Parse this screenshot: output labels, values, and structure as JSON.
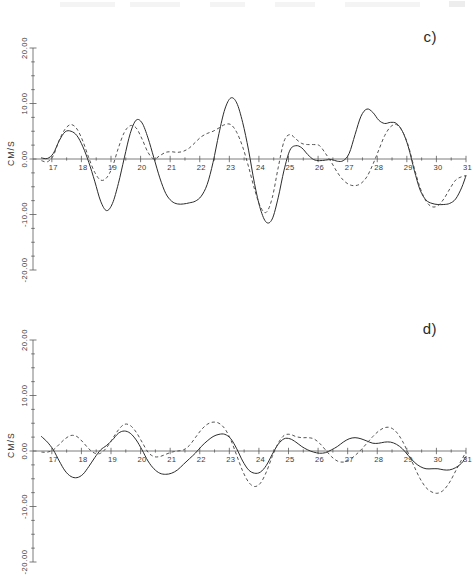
{
  "figure": {
    "panels": [
      {
        "id": "c",
        "label": "c)",
        "axis_title": "CM/S"
      },
      {
        "id": "d",
        "label": "d)",
        "axis_title": "CM/S"
      }
    ]
  },
  "chart_data": [
    {
      "type": "line",
      "title": "c)",
      "xlabel": "",
      "ylabel": "CM/S",
      "xlim": [
        16.6,
        31.0
      ],
      "ylim": [
        -20.0,
        20.0
      ],
      "grid": false,
      "legend_position": "none",
      "xticks": [
        17,
        18,
        19,
        20,
        21,
        22,
        23,
        24,
        25,
        26,
        27,
        28,
        29,
        30,
        31
      ],
      "xtick_labels": [
        "17",
        "18",
        "19",
        "20",
        "21",
        "22",
        "23",
        "24",
        "25",
        "26",
        "27",
        "28",
        "29",
        "30",
        "31"
      ],
      "yticks": [
        20.0,
        10.0,
        0.0,
        -10.0,
        -20.0
      ],
      "ytick_labels": [
        "20.00",
        "10.00",
        "0.00",
        "-20.00",
        "-20.00"
      ],
      "ytick_labels_actual": [
        "20.00",
        "10.00",
        "0.00",
        "-10.00",
        "-20.00"
      ],
      "series": [
        {
          "name": "solid",
          "style": "solid",
          "x": [
            16.65,
            16.85,
            17.05,
            17.25,
            17.45,
            17.65,
            17.85,
            18.05,
            18.25,
            18.45,
            18.65,
            18.85,
            19.05,
            19.25,
            19.45,
            19.65,
            19.85,
            20.05,
            20.25,
            20.45,
            20.65,
            20.85,
            21.05,
            21.25,
            21.45,
            21.65,
            21.85,
            22.05,
            22.25,
            22.45,
            22.65,
            22.85,
            23.05,
            23.25,
            23.45,
            23.65,
            23.85,
            24.05,
            24.25,
            24.45,
            24.65,
            24.85,
            25.05,
            25.25,
            25.45,
            25.65,
            25.85,
            26.05,
            26.25,
            26.45,
            26.65,
            26.85,
            27.05,
            27.25,
            27.45,
            27.65,
            27.85,
            28.05,
            28.25,
            28.45,
            28.65,
            28.85,
            29.05,
            29.25,
            29.45,
            29.65,
            29.85,
            30.05,
            30.25,
            30.45,
            30.65,
            30.85,
            31.0
          ],
          "y": [
            0.2,
            0.1,
            1.0,
            3.3,
            4.9,
            5.0,
            4.2,
            2.2,
            -0.6,
            -4.0,
            -7.6,
            -9.3,
            -8.0,
            -4.4,
            0.2,
            4.6,
            7.0,
            6.5,
            3.8,
            0.2,
            -3.4,
            -6.2,
            -7.6,
            -8.1,
            -8.1,
            -7.9,
            -7.6,
            -6.7,
            -4.6,
            -0.6,
            4.6,
            9.0,
            11.0,
            10.1,
            6.6,
            1.6,
            -4.4,
            -9.0,
            -11.4,
            -10.8,
            -7.0,
            -2.0,
            1.6,
            2.4,
            2.0,
            0.8,
            -0.1,
            -0.3,
            -0.2,
            -0.1,
            -0.4,
            -0.3,
            1.0,
            4.4,
            7.7,
            9.0,
            8.4,
            7.0,
            6.4,
            6.6,
            6.4,
            5.0,
            2.2,
            -2.0,
            -5.6,
            -7.4,
            -8.0,
            -8.2,
            -8.2,
            -8.0,
            -7.2,
            -5.2,
            -3.0
          ]
        },
        {
          "name": "dashed",
          "style": "dashed",
          "x": [
            16.65,
            16.85,
            17.05,
            17.25,
            17.45,
            17.65,
            17.85,
            18.05,
            18.25,
            18.45,
            18.65,
            18.85,
            19.05,
            19.25,
            19.45,
            19.65,
            19.85,
            20.05,
            20.25,
            20.45,
            20.65,
            20.85,
            21.05,
            21.25,
            21.45,
            21.65,
            21.85,
            22.05,
            22.25,
            22.45,
            22.65,
            22.85,
            23.05,
            23.25,
            23.45,
            23.65,
            23.85,
            24.05,
            24.25,
            24.45,
            24.65,
            24.85,
            25.05,
            25.25,
            25.45,
            25.65,
            25.85,
            26.05,
            26.25,
            26.45,
            26.65,
            26.85,
            27.05,
            27.25,
            27.45,
            27.65,
            27.85,
            28.05,
            28.25,
            28.45,
            28.65,
            28.85,
            29.05,
            29.25,
            29.45,
            29.65,
            29.85,
            30.05,
            30.25,
            30.45,
            30.65,
            30.85,
            31.0
          ],
          "y": [
            -0.3,
            -0.5,
            0.6,
            3.4,
            5.4,
            6.2,
            5.4,
            3.2,
            0.2,
            -2.4,
            -3.8,
            -3.4,
            -1.4,
            2.0,
            4.8,
            6.0,
            5.6,
            3.6,
            1.2,
            0.0,
            0.6,
            1.2,
            1.3,
            1.2,
            1.4,
            2.0,
            3.0,
            4.0,
            4.6,
            5.0,
            5.6,
            6.2,
            6.2,
            4.8,
            2.2,
            -1.4,
            -5.4,
            -8.6,
            -9.6,
            -7.0,
            -1.6,
            3.2,
            4.4,
            3.6,
            2.8,
            2.6,
            2.6,
            2.4,
            1.0,
            -0.6,
            -2.4,
            -3.8,
            -4.6,
            -4.8,
            -4.4,
            -3.2,
            -1.0,
            1.6,
            4.2,
            5.8,
            6.2,
            5.0,
            2.4,
            -1.6,
            -5.2,
            -7.6,
            -8.6,
            -8.4,
            -7.2,
            -5.4,
            -3.8,
            -3.2,
            -3.0
          ]
        }
      ]
    },
    {
      "type": "line",
      "title": "d)",
      "xlabel": "",
      "ylabel": "CM/S",
      "xlim": [
        16.6,
        31.0
      ],
      "ylim": [
        -20.0,
        20.0
      ],
      "grid": false,
      "legend_position": "none",
      "xticks": [
        17,
        18,
        19,
        20,
        21,
        22,
        23,
        24,
        25,
        26,
        27,
        28,
        29,
        30,
        31
      ],
      "xtick_labels": [
        "17",
        "18",
        "19",
        "20",
        "21",
        "22",
        "23",
        "24",
        "25",
        "26",
        "27",
        "28",
        "29",
        "30",
        "31"
      ],
      "yticks": [
        20.0,
        10.0,
        0.0,
        -10.0,
        -20.0
      ],
      "ytick_labels": [
        "20.00",
        "10.00",
        "0.00",
        "-10.00",
        "-20.00"
      ],
      "series": [
        {
          "name": "solid",
          "style": "solid",
          "x": [
            16.65,
            16.85,
            17.05,
            17.25,
            17.45,
            17.65,
            17.85,
            18.05,
            18.25,
            18.45,
            18.65,
            18.85,
            19.05,
            19.25,
            19.45,
            19.65,
            19.85,
            20.05,
            20.25,
            20.45,
            20.65,
            20.85,
            21.05,
            21.25,
            21.45,
            21.65,
            21.85,
            22.05,
            22.25,
            22.45,
            22.65,
            22.85,
            23.05,
            23.25,
            23.45,
            23.65,
            23.85,
            24.05,
            24.25,
            24.45,
            24.65,
            24.85,
            25.05,
            25.25,
            25.45,
            25.65,
            25.85,
            26.05,
            26.25,
            26.45,
            26.65,
            26.85,
            27.05,
            27.25,
            27.45,
            27.65,
            27.85,
            28.05,
            28.25,
            28.45,
            28.65,
            28.85,
            29.05,
            29.25,
            29.45,
            29.65,
            29.85,
            30.05,
            30.25,
            30.45,
            30.65,
            30.85,
            31.0
          ],
          "y": [
            2.6,
            1.6,
            0.2,
            -1.8,
            -3.6,
            -4.6,
            -4.8,
            -4.2,
            -2.8,
            -1.2,
            0.2,
            1.0,
            2.0,
            3.2,
            3.6,
            3.2,
            2.0,
            0.2,
            -1.8,
            -3.2,
            -4.0,
            -4.2,
            -4.0,
            -3.4,
            -2.4,
            -1.4,
            -0.4,
            0.8,
            1.8,
            2.6,
            3.0,
            3.0,
            2.2,
            0.4,
            -1.8,
            -3.4,
            -4.0,
            -3.8,
            -2.6,
            -0.6,
            1.2,
            2.2,
            2.2,
            1.6,
            0.8,
            0.2,
            -0.2,
            -0.4,
            -0.3,
            0.2,
            0.8,
            1.6,
            2.2,
            2.4,
            2.2,
            1.8,
            1.4,
            1.4,
            1.6,
            1.6,
            1.2,
            0.4,
            -0.8,
            -2.0,
            -2.8,
            -3.2,
            -3.2,
            -3.2,
            -3.4,
            -3.4,
            -3.0,
            -2.2,
            -1.0
          ]
        },
        {
          "name": "dashed",
          "style": "dashed",
          "x": [
            16.65,
            16.85,
            17.05,
            17.25,
            17.45,
            17.65,
            17.85,
            18.05,
            18.25,
            18.45,
            18.65,
            18.85,
            19.05,
            19.25,
            19.45,
            19.65,
            19.85,
            20.05,
            20.25,
            20.45,
            20.65,
            20.85,
            21.05,
            21.25,
            21.45,
            21.65,
            21.85,
            22.05,
            22.25,
            22.45,
            22.65,
            22.85,
            23.05,
            23.25,
            23.45,
            23.65,
            23.85,
            24.05,
            24.25,
            24.45,
            24.65,
            24.85,
            25.05,
            25.25,
            25.45,
            25.65,
            25.85,
            26.05,
            26.25,
            26.45,
            26.65,
            26.85,
            27.05,
            27.25,
            27.45,
            27.65,
            27.85,
            28.05,
            28.25,
            28.45,
            28.65,
            28.85,
            29.05,
            29.25,
            29.45,
            29.65,
            29.85,
            30.05,
            30.25,
            30.45,
            30.65,
            30.85,
            31.0
          ],
          "y": [
            -0.2,
            -0.2,
            0.2,
            1.2,
            2.2,
            2.8,
            2.6,
            1.6,
            0.4,
            -0.4,
            -0.4,
            0.6,
            2.2,
            3.8,
            4.8,
            4.6,
            3.4,
            1.6,
            -0.2,
            -1.0,
            -1.0,
            -0.6,
            -0.2,
            0.0,
            0.2,
            1.0,
            2.4,
            3.8,
            4.8,
            5.2,
            5.0,
            4.0,
            2.0,
            -0.8,
            -3.6,
            -5.6,
            -6.4,
            -5.8,
            -3.8,
            -1.0,
            1.4,
            2.8,
            3.0,
            2.6,
            2.4,
            2.4,
            2.2,
            1.4,
            0.2,
            -1.0,
            -1.8,
            -2.0,
            -1.6,
            -0.8,
            0.2,
            1.4,
            2.6,
            3.6,
            4.2,
            4.2,
            3.4,
            1.8,
            -0.4,
            -2.8,
            -5.0,
            -6.6,
            -7.4,
            -7.6,
            -7.0,
            -5.6,
            -3.6,
            -1.6,
            -0.2
          ]
        }
      ]
    }
  ]
}
